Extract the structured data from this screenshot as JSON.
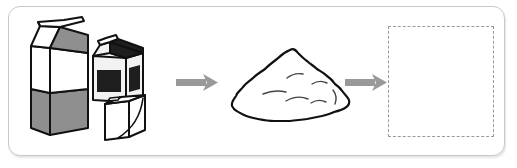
{
  "scene": {
    "title": "Milk cartons recycling process diagram",
    "type": "process-flow-illustration",
    "steps": 3,
    "background_color": "#ffffff",
    "panel_border_color": "#c8c8c8"
  },
  "colors": {
    "outline": "#111111",
    "gray_fill": "#8f8f8f",
    "dark_fill": "#1e1e1e",
    "light_fill": "#f2f2f2",
    "white_fill": "#ffffff",
    "arrow": "#999999",
    "dashed_border": "#9a9a9a"
  },
  "items": [
    {
      "name": "milk-cartons-group",
      "label": "Milk cartons",
      "stage": 1,
      "parts": [
        {
          "name": "large-carton",
          "label": "Large gable-top milk carton",
          "top_left_color": "#ffffff",
          "top_right_color": "#8f8f8f",
          "body_upper_color": "#ffffff",
          "body_lower_color": "#8f8f8f"
        },
        {
          "name": "medium-carton",
          "label": "Medium carton with dark panels",
          "gable_color": "#1e1e1e",
          "body_color": "#f2f2f2",
          "panel_color": "#1e1e1e"
        },
        {
          "name": "small-carton",
          "label": "Small white carton",
          "body_color": "#ffffff"
        }
      ]
    },
    {
      "name": "pulp-pile",
      "label": "Pile of shredded paper pulp",
      "stage": 2,
      "fill_color": "#ffffff",
      "outline_color": "#111111"
    },
    {
      "name": "empty-dropzone",
      "label": "Empty answer box",
      "stage": 3,
      "state": "empty",
      "border_style": "dashed"
    }
  ],
  "arrows": [
    {
      "name": "arrow-1",
      "label": "leads to",
      "from": "milk-cartons-group",
      "to": "pulp-pile",
      "direction": "right",
      "color": "#999999"
    },
    {
      "name": "arrow-2",
      "label": "leads to",
      "from": "pulp-pile",
      "to": "empty-dropzone",
      "direction": "right",
      "color": "#999999"
    }
  ]
}
